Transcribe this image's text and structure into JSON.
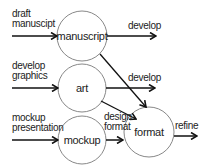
{
  "diagram": {
    "nodes": [
      {
        "id": "manuscript",
        "label": "manuscript",
        "cx": 82,
        "cy": 36,
        "r": 25
      },
      {
        "id": "art",
        "label": "art",
        "cx": 82,
        "cy": 88,
        "r": 24
      },
      {
        "id": "mockup",
        "label": "mockup",
        "cx": 82,
        "cy": 140,
        "r": 24
      },
      {
        "id": "format",
        "label": "format",
        "cx": 149,
        "cy": 132,
        "r": 25
      }
    ],
    "inputs": [
      {
        "line1": "draft",
        "line2": "manuscipt",
        "target": "manuscript"
      },
      {
        "line1": "develop",
        "line2": "graphics",
        "target": "art"
      },
      {
        "line1": "mockup",
        "line2": "presentation",
        "target": "mockup"
      }
    ],
    "outputs": [
      {
        "from": "manuscript",
        "label": "develop"
      },
      {
        "from": "art",
        "label": "develop"
      },
      {
        "from": "mockup",
        "to": "format",
        "line1": "design",
        "line2": "format"
      },
      {
        "from": "format",
        "label": "refine"
      }
    ],
    "edges": [
      {
        "from": "manuscript",
        "to": "format"
      },
      {
        "from": "art",
        "to": "format"
      }
    ],
    "colors": {
      "stroke": "#111111",
      "circle": "#888888",
      "text": "#222222"
    }
  }
}
